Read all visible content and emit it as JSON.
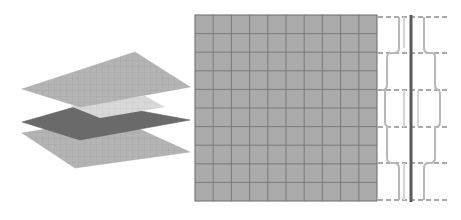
{
  "diagram": {
    "colors": {
      "background": "#ffffff",
      "plate_light": "#b4b4b4",
      "plate_dark": "#6a6a6a",
      "plate_cutout": "#d8d8d8",
      "plate_grid_line": "#9a9a9a",
      "grid_fill": "#aaaaaa",
      "grid_line": "#6e6e6e",
      "grid_border": "#7a7a7a",
      "profile_line": "#b8b8b8",
      "center_bar": "#5a5a5a",
      "dash_line": "#555555"
    },
    "exploded_view": {
      "plates": [
        {
          "name": "top-plate",
          "shade": "light",
          "points": [
            [
              22,
              89
            ],
            [
              135,
              52
            ],
            [
              190,
              87
            ],
            [
              80,
              107
            ]
          ]
        },
        {
          "name": "middle-plate",
          "shade": "dark",
          "points": [
            [
              22,
              122
            ],
            [
              92,
              102
            ],
            [
              190,
              120
            ],
            [
              80,
              140
            ]
          ],
          "cutout": [
            [
              72,
              105
            ],
            [
              140,
              94
            ],
            [
              165,
              106
            ],
            [
              100,
              118
            ]
          ]
        },
        {
          "name": "bottom-plate",
          "shade": "light",
          "points": [
            [
              22,
              133
            ],
            [
              115,
              116
            ],
            [
              190,
              152
            ],
            [
              75,
              168
            ]
          ]
        }
      ],
      "grid_divisions": 12
    },
    "front_grid": {
      "x": 195,
      "y": 15,
      "width": 182,
      "height": 186,
      "columns": 10,
      "rows": 10
    },
    "side_profile": {
      "dash_levels_y": [
        17,
        53,
        90,
        127,
        163,
        200
      ],
      "dash_x_start": 378,
      "dash_x_end": 448,
      "center_bar_x": 411
    }
  }
}
